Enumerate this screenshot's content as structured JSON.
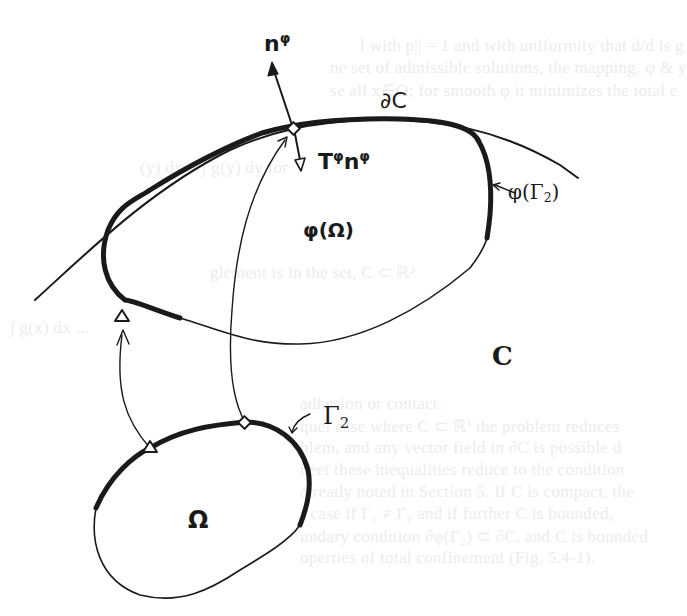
{
  "figure": {
    "labels": {
      "normal": {
        "base": "n",
        "sup": "φ"
      },
      "traction": {
        "t": "T",
        "t_sup": "φ",
        "n": "n",
        "n_sup": "φ"
      },
      "boundary_C": "∂C",
      "deformed_body": "φ(Ω)",
      "deformed_gamma2": {
        "prefix": "φ(Γ",
        "sub": "2",
        "suffix": ")"
      },
      "constraint_set": "C",
      "reference_body": "Ω",
      "gamma2": {
        "base": "Γ",
        "sub": "2"
      }
    },
    "colors": {
      "ink": "#1a1a1a",
      "background": "#ffffff",
      "ghost_text": "#ececec"
    }
  },
  "ghost_text": [
    "l with p|| = 1 and with uniformity that d/d is g",
    "ne set of admissible solutions, the mapping, φ & y",
    "se all x∈Ω; for smooth φ it minimizes the total e",
    "(y) dx + ∫ g(y) dy   for",
    "glement is in the set, C ⊂ ℝ³",
    "∫ g(x) dx ...",
    "adhesion or contact.",
    "quel case where C ⊂ ℝ³ the problem reduces",
    "blem, and any vector field in ∂C is possible d",
    "neet these inequalities reduce to the condition",
    "already noted in Section 5. If C is compact, the",
    "I case if Γ₁ ≠ Γ₂ and if further C is bounded,",
    "undary condition ∂φ(Γ₂) ⊂ ∂C, and C is bounded",
    "operties of total confinement (Fig. 5.4-1)."
  ]
}
